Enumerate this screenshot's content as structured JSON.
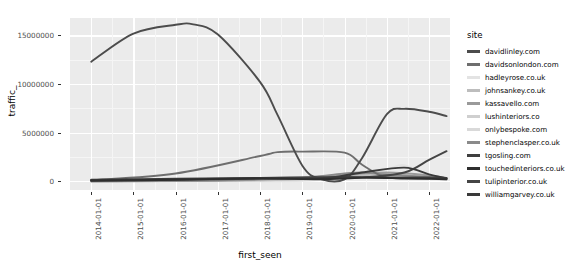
{
  "chart_data": {
    "type": "line",
    "title": "",
    "xlabel": "first_seen",
    "ylabel": "traffic_",
    "legend_title": "site",
    "legend_position": "right",
    "grid": true,
    "x_type": "date",
    "xlim": [
      "2013-07-01",
      "2022-07-01"
    ],
    "ylim": [
      -900000,
      16800000
    ],
    "xticks": [
      "2014-01-01",
      "2015-01-01",
      "2016-01-01",
      "2017-01-01",
      "2018-01-01",
      "2019-01-01",
      "2020-01-01",
      "2021-01-01",
      "2022-01-01"
    ],
    "yticks": [
      0,
      5000000,
      10000000,
      15000000
    ],
    "ytick_labels": [
      "0",
      "5000000",
      "10000000",
      "15000000"
    ],
    "series": [
      {
        "name": "davidlinley.com",
        "color": "#4c4c4c",
        "x": [
          "2014-01-01",
          "2015-01-01",
          "2016-01-01",
          "2016-06-01",
          "2017-01-01",
          "2018-01-01",
          "2018-06-01",
          "2019-01-01",
          "2019-06-01",
          "2020-01-01",
          "2020-06-01",
          "2021-01-01",
          "2021-06-01",
          "2022-01-01",
          "2022-06-01"
        ],
        "values": [
          12300000,
          15200000,
          16100000,
          16150000,
          15100000,
          10200000,
          6800000,
          1600000,
          250000,
          200000,
          2400000,
          6900000,
          7450000,
          7150000,
          6700000
        ]
      },
      {
        "name": "davidsonlondon.com",
        "color": "#6e6e6e",
        "x": [
          "2014-01-01",
          "2016-01-01",
          "2018-01-01",
          "2018-06-01",
          "2019-01-01",
          "2020-01-01",
          "2020-06-01",
          "2021-01-01",
          "2022-01-01",
          "2022-06-01"
        ],
        "values": [
          100000,
          800000,
          2600000,
          3000000,
          3050000,
          2950000,
          1700000,
          400000,
          300000,
          250000
        ]
      },
      {
        "name": "hadleyrose.co.uk",
        "color": "#e3e3e3",
        "x": [
          "2018-01-01",
          "2019-01-01",
          "2020-01-01",
          "2020-06-01",
          "2021-01-01",
          "2021-06-01",
          "2022-01-01",
          "2022-06-01"
        ],
        "values": [
          0,
          50000,
          300000,
          600000,
          1200000,
          1650000,
          500000,
          200000
        ]
      },
      {
        "name": "johnsankey.co.uk",
        "color": "#bdbdbd",
        "x": [
          "2014-01-01",
          "2017-01-01",
          "2019-01-01",
          "2020-01-01",
          "2021-01-01",
          "2022-01-01",
          "2022-06-01"
        ],
        "values": [
          0,
          50000,
          200000,
          500000,
          700000,
          400000,
          250000
        ]
      },
      {
        "name": "kassavello.com",
        "color": "#9a9a9a",
        "x": [
          "2014-01-01",
          "2017-01-01",
          "2019-01-01",
          "2020-01-01",
          "2021-01-01",
          "2022-01-01",
          "2022-06-01"
        ],
        "values": [
          0,
          60000,
          350000,
          650000,
          900000,
          600000,
          300000
        ]
      },
      {
        "name": "lushinteriors.co",
        "color": "#cfcfcf",
        "x": [
          "2014-01-01",
          "2018-01-01",
          "2019-01-01",
          "2020-01-01",
          "2021-01-01",
          "2022-01-01",
          "2022-06-01"
        ],
        "values": [
          0,
          80000,
          300000,
          550000,
          400000,
          250000,
          150000
        ]
      },
      {
        "name": "onlybespoke.com",
        "color": "#d9d9d9",
        "x": [
          "2014-01-01",
          "2018-01-01",
          "2019-06-01",
          "2020-06-01",
          "2021-06-01",
          "2022-06-01"
        ],
        "values": [
          0,
          60000,
          250000,
          450000,
          350000,
          200000
        ]
      },
      {
        "name": "stephenclasper.co.uk",
        "color": "#8a8a8a",
        "x": [
          "2014-01-01",
          "2017-01-01",
          "2019-01-01",
          "2020-01-01",
          "2020-06-01",
          "2021-01-01",
          "2022-01-01",
          "2022-06-01"
        ],
        "values": [
          0,
          100000,
          400000,
          800000,
          900000,
          700000,
          450000,
          300000
        ]
      },
      {
        "name": "tgosling.com",
        "color": "#3f3f3f",
        "x": [
          "2014-01-01",
          "2016-01-01",
          "2018-01-01",
          "2019-01-01",
          "2020-01-01",
          "2021-01-01",
          "2022-01-01",
          "2022-06-01"
        ],
        "values": [
          150000,
          250000,
          350000,
          400000,
          450000,
          400000,
          380000,
          350000
        ]
      },
      {
        "name": "touchedinteriors.co.uk",
        "color": "#2e2e2e",
        "x": [
          "2014-01-01",
          "2016-01-01",
          "2018-01-01",
          "2019-06-01",
          "2020-06-01",
          "2021-06-01",
          "2022-01-01",
          "2022-06-01"
        ],
        "values": [
          50000,
          150000,
          300000,
          200000,
          350000,
          300000,
          250000,
          200000
        ]
      },
      {
        "name": "tulipinterior.co.uk",
        "color": "#454545",
        "x": [
          "2014-01-01",
          "2017-01-01",
          "2019-01-01",
          "2020-06-01",
          "2021-06-01",
          "2022-01-01",
          "2022-06-01"
        ],
        "values": [
          100000,
          200000,
          300000,
          400000,
          900000,
          2200000,
          3100000
        ]
      },
      {
        "name": "williamgarvey.co.uk",
        "color": "#3a3a3a",
        "x": [
          "2014-01-01",
          "2016-01-01",
          "2018-01-01",
          "2019-06-01",
          "2020-06-01",
          "2021-06-01",
          "2022-01-01",
          "2022-06-01"
        ],
        "values": [
          120000,
          200000,
          320000,
          260000,
          900000,
          1400000,
          700000,
          300000
        ]
      }
    ]
  }
}
